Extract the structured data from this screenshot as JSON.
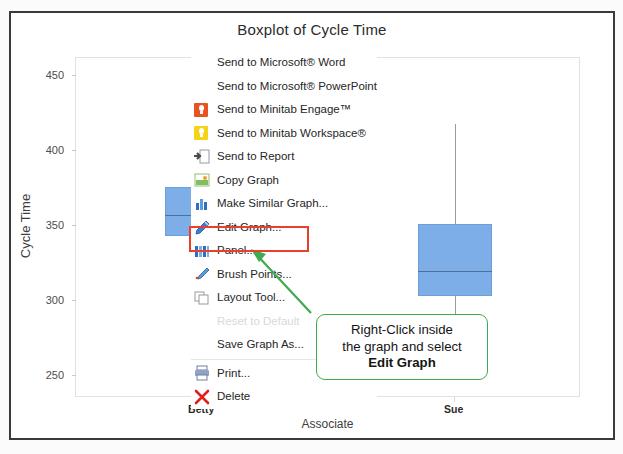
{
  "chart_data": {
    "type": "boxplot",
    "title": "Boxplot of Cycle Time",
    "xlabel": "Associate",
    "ylabel": "Cycle Time",
    "ylim": [
      235,
      462
    ],
    "yticks": [
      250,
      300,
      350,
      400,
      450
    ],
    "grid": false,
    "categories": [
      "Betty",
      "Sue"
    ],
    "boxes": [
      {
        "category": "Betty",
        "lower_whisker": 258,
        "q1": 343,
        "median": 357,
        "q3": 376,
        "upper_whisker": 413,
        "outliers": [
          439,
          443,
          446,
          450
        ]
      },
      {
        "category": "Sue",
        "lower_whisker": 248,
        "q1": 303,
        "median": 320,
        "q3": 351,
        "upper_whisker": 418,
        "outliers": []
      }
    ]
  },
  "context_menu": {
    "items": [
      {
        "label": "Send to Microsoft® Word",
        "icon": "none",
        "disabled": false
      },
      {
        "label": "Send to Microsoft® PowerPoint",
        "icon": "none",
        "disabled": false
      },
      {
        "label": "Send to Minitab Engage™",
        "icon": "minitab-engage-icon",
        "disabled": false
      },
      {
        "label": "Send to Minitab Workspace®",
        "icon": "minitab-workspace-icon",
        "disabled": false
      },
      {
        "label": "Send to Report",
        "icon": "send-to-report-icon",
        "disabled": false
      },
      {
        "label": "Copy Graph",
        "icon": "copy-graph-icon",
        "disabled": false
      },
      {
        "label": "Make Similar Graph...",
        "icon": "make-similar-graph-icon",
        "disabled": false
      },
      {
        "label": "Edit Graph...",
        "icon": "edit-graph-pencil-icon",
        "disabled": false
      },
      {
        "label": "Panel...",
        "icon": "panel-icon",
        "disabled": false
      },
      {
        "label": "Brush Points...",
        "icon": "brush-points-icon",
        "disabled": false
      },
      {
        "label": "Layout Tool...",
        "icon": "layout-tool-icon",
        "disabled": false
      },
      {
        "label": "Reset to Default",
        "icon": "none",
        "disabled": true
      },
      {
        "label": "Save Graph As...",
        "icon": "none",
        "disabled": false
      },
      {
        "label": "Print...",
        "icon": "print-icon",
        "disabled": false
      },
      {
        "label": "Delete",
        "icon": "delete-x-icon",
        "disabled": false
      }
    ],
    "highlighted_item": "Edit Graph..."
  },
  "callout": {
    "line1": "Right-Click inside",
    "line2": "the graph and select",
    "line3": "Edit Graph"
  },
  "colors": {
    "box_fill": "#7eaee8",
    "highlight_border": "#e8402a",
    "callout_border": "#3faa4f",
    "arrow": "#3faa4f",
    "frame": "#3a3a3a"
  }
}
